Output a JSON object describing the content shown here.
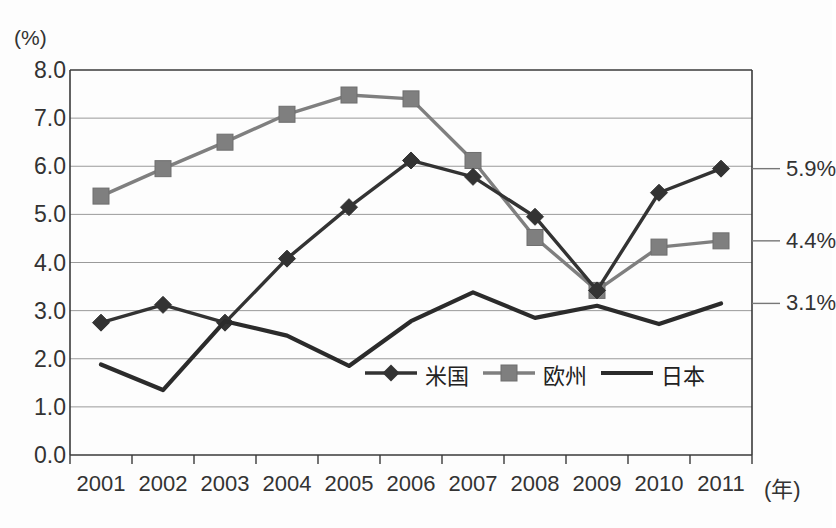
{
  "chart_data": {
    "type": "line",
    "title": "",
    "xlabel": "(年)",
    "ylabel": "(%)",
    "unit_label": "(%)",
    "x_axis_suffix": "(年)",
    "categories": [
      "2001",
      "2002",
      "2003",
      "2004",
      "2005",
      "2006",
      "2007",
      "2008",
      "2009",
      "2010",
      "2011"
    ],
    "ylim": [
      0.0,
      8.0
    ],
    "yticks": [
      "0.0",
      "1.0",
      "2.0",
      "3.0",
      "4.0",
      "5.0",
      "6.0",
      "7.0",
      "8.0"
    ],
    "ytick_values": [
      0.0,
      1.0,
      2.0,
      3.0,
      4.0,
      5.0,
      6.0,
      7.0,
      8.0
    ],
    "grid": true,
    "legend_position": "inside-bottom-center",
    "series": [
      {
        "name": "米国",
        "marker": "diamond",
        "color": "#333333",
        "values": [
          2.75,
          3.12,
          2.75,
          4.08,
          5.15,
          6.12,
          5.78,
          4.95,
          3.42,
          5.45,
          5.95
        ]
      },
      {
        "name": "欧州",
        "marker": "square",
        "color": "#7f7f7f",
        "values": [
          5.38,
          5.95,
          6.5,
          7.08,
          7.48,
          7.4,
          6.12,
          4.52,
          3.42,
          4.32,
          4.45
        ]
      },
      {
        "name": "日本",
        "marker": "none",
        "color": "#2b2b2b",
        "values": [
          1.88,
          1.35,
          2.78,
          2.48,
          1.85,
          2.78,
          3.38,
          2.85,
          3.1,
          2.72,
          3.15
        ]
      }
    ],
    "end_labels": [
      {
        "series": "米国",
        "text": "5.9%",
        "value": 5.95
      },
      {
        "series": "欧州",
        "text": "4.4%",
        "value": 4.45
      },
      {
        "series": "日本",
        "text": "3.1%",
        "value": 3.15
      }
    ]
  },
  "legend": {
    "items": [
      {
        "label": "米国",
        "marker": "diamond",
        "color": "#333333"
      },
      {
        "label": "欧州",
        "marker": "square",
        "color": "#7f7f7f"
      },
      {
        "label": "日本",
        "marker": "none",
        "color": "#2b2b2b"
      }
    ]
  }
}
